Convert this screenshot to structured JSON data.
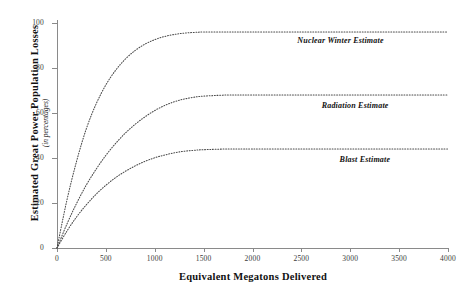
{
  "chart_data": {
    "type": "line",
    "title": "",
    "xlabel": "Equivalent Megatons Delivered",
    "ylabel": "Estimated Great Power Population Losses",
    "ylabel_subtitle": "(in percentages)",
    "xlim": [
      0,
      4000
    ],
    "ylim": [
      0,
      100
    ],
    "xticks": [
      0,
      500,
      1000,
      1500,
      2000,
      2500,
      3000,
      3500,
      4000
    ],
    "yticks": [
      0,
      20,
      40,
      60,
      80,
      100
    ],
    "grid": false,
    "legend_position": "inline-right-annotations",
    "line_style": "dotted",
    "x": [
      0,
      100,
      200,
      300,
      400,
      500,
      600,
      700,
      800,
      900,
      1000,
      1100,
      1200,
      1300,
      1400,
      1500,
      1750,
      2000,
      2500,
      3000,
      3500,
      4000
    ],
    "series": [
      {
        "name": "Nuclear Winter Estimate",
        "plateau": 96,
        "values": [
          0,
          21,
          38.5,
          53,
          64,
          72.5,
          79,
          84,
          87.8,
          90.6,
          92.6,
          94,
          94.9,
          95.5,
          95.8,
          96,
          96,
          96,
          96,
          96,
          96,
          96
        ]
      },
      {
        "name": "Radiation Estimate",
        "plateau": 68,
        "values": [
          0,
          10.5,
          19.8,
          28,
          35,
          41.2,
          46.5,
          51.1,
          55,
          58.3,
          61.1,
          63.3,
          65,
          66.2,
          67,
          67.5,
          68,
          68,
          68,
          68,
          68,
          68
        ]
      },
      {
        "name": "Blast Estimate",
        "plateau": 44,
        "values": [
          0,
          7.4,
          13.8,
          19.2,
          23.9,
          27.9,
          31.3,
          34.1,
          36.5,
          38.5,
          40.1,
          41.3,
          42.3,
          43,
          43.4,
          43.7,
          44,
          44,
          44,
          44,
          44,
          44
        ]
      }
    ],
    "annotations": [
      {
        "text": "Nuclear Winter Estimate",
        "x": 2900,
        "y": 92
      },
      {
        "text": "Radiation Estimate",
        "x": 3050,
        "y": 63
      },
      {
        "text": "Blast Estimate",
        "x": 3150,
        "y": 39
      }
    ]
  }
}
